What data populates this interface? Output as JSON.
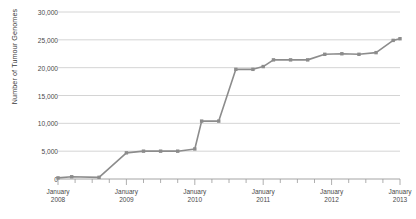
{
  "chart_data": {
    "type": "line",
    "title": "",
    "xlabel": "",
    "ylabel": "Number of Tumour Genomes",
    "ylim": [
      0,
      30000
    ],
    "ytick_labels": [
      "0",
      "5,000",
      "10,000",
      "15,000",
      "20,000",
      "25,000",
      "30,000"
    ],
    "ytick_values": [
      0,
      5000,
      10000,
      15000,
      20000,
      25000,
      30000
    ],
    "xtick_labels": [
      {
        "month": "January",
        "year": "2008"
      },
      {
        "month": "January",
        "year": "2009"
      },
      {
        "month": "January",
        "year": "2010"
      },
      {
        "month": "January",
        "year": "2011"
      },
      {
        "month": "January",
        "year": "2012"
      },
      {
        "month": "January",
        "year": "2013"
      }
    ],
    "xlim": [
      2008.0,
      2013.0
    ],
    "grid": "horizontal",
    "legend": "none",
    "line_color": "#8c8c8c",
    "marker": "square",
    "marker_color": "#8c8c8c",
    "x": [
      2008.0,
      2008.2,
      2008.6,
      2009.0,
      2009.25,
      2009.5,
      2009.75,
      2010.0,
      2010.1,
      2010.35,
      2010.6,
      2010.85,
      2011.0,
      2011.15,
      2011.4,
      2011.65,
      2011.9,
      2012.15,
      2012.4,
      2012.65,
      2012.9,
      2013.0
    ],
    "values": [
      200,
      400,
      300,
      4700,
      5000,
      5000,
      5000,
      5400,
      10400,
      10400,
      19700,
      19700,
      20200,
      21400,
      21400,
      21400,
      22400,
      22500,
      22400,
      22700,
      24900,
      25200
    ],
    "series": [
      {
        "name": "Tumour Genomes",
        "points": [
          {
            "x": 2008.0,
            "y": 200
          },
          {
            "x": 2008.2,
            "y": 400
          },
          {
            "x": 2008.6,
            "y": 300
          },
          {
            "x": 2009.0,
            "y": 4700
          },
          {
            "x": 2009.25,
            "y": 5000
          },
          {
            "x": 2009.5,
            "y": 5000
          },
          {
            "x": 2009.75,
            "y": 5000
          },
          {
            "x": 2010.0,
            "y": 5400
          },
          {
            "x": 2010.1,
            "y": 10400
          },
          {
            "x": 2010.35,
            "y": 10400
          },
          {
            "x": 2010.6,
            "y": 19700
          },
          {
            "x": 2010.85,
            "y": 19700
          },
          {
            "x": 2011.0,
            "y": 20200
          },
          {
            "x": 2011.15,
            "y": 21400
          },
          {
            "x": 2011.4,
            "y": 21400
          },
          {
            "x": 2011.65,
            "y": 21400
          },
          {
            "x": 2011.9,
            "y": 22400
          },
          {
            "x": 2012.15,
            "y": 22500
          },
          {
            "x": 2012.4,
            "y": 22400
          },
          {
            "x": 2012.65,
            "y": 22700
          },
          {
            "x": 2012.9,
            "y": 24900
          },
          {
            "x": 2013.0,
            "y": 25200
          }
        ]
      }
    ]
  }
}
